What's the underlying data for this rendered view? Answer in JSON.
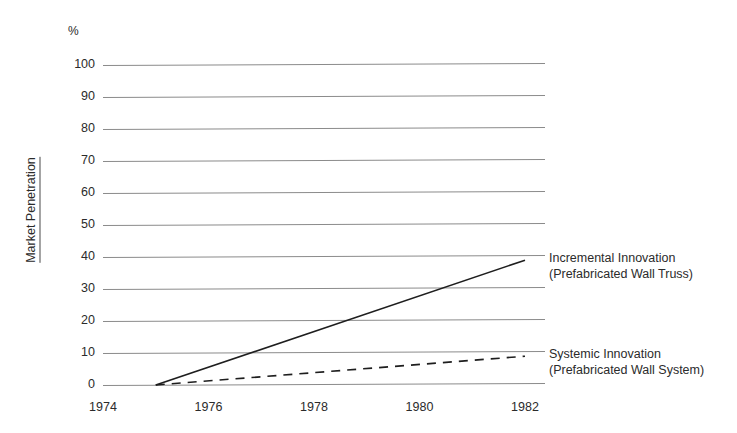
{
  "chart_data": {
    "type": "line",
    "title": "",
    "subtitle": "",
    "xlabel": "",
    "ylabel": "Market Penetration",
    "yunit": "%",
    "xlim": [
      1974,
      1982.6
    ],
    "ylim": [
      0,
      100
    ],
    "grid": true,
    "grid_axis": "y",
    "legend_position": "right-inline",
    "x_ticks": [
      "1974",
      "1976",
      "1978",
      "1980",
      "1982"
    ],
    "x_tick_values": [
      1974,
      1976,
      1978,
      1980,
      1982
    ],
    "y_ticks": [
      "0",
      "10",
      "20",
      "30",
      "40",
      "50",
      "60",
      "70",
      "80",
      "90",
      "100"
    ],
    "y_tick_values": [
      0,
      10,
      20,
      30,
      40,
      50,
      60,
      70,
      80,
      90,
      100
    ],
    "series": [
      {
        "name": "Incremental Innovation",
        "sublabel": "(Prefabricated Wall Truss)",
        "style": "solid",
        "color": "#1e1e1e",
        "x": [
          1975,
          1982
        ],
        "values": [
          0,
          39
        ]
      },
      {
        "name": "Systemic Innovation",
        "sublabel": "(Prefabricated Wall System)",
        "style": "dashed",
        "color": "#1e1e1e",
        "x": [
          1975,
          1982
        ],
        "values": [
          0,
          9
        ]
      }
    ]
  },
  "axis": {
    "percent_symbol": "%",
    "y_title": "Market Penetration"
  },
  "legend": {
    "items": [
      {
        "line1": "Incremental Innovation",
        "line2": "(Prefabricated Wall Truss)"
      },
      {
        "line1": "Systemic Innovation",
        "line2": "(Prefabricated Wall System)"
      }
    ]
  },
  "colors": {
    "background": "#ffffff",
    "gridline": "#8b8b8b",
    "text": "#2b2b2b",
    "series_line": "#1e1e1e"
  }
}
